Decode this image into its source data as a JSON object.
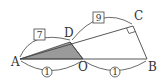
{
  "diagram": {
    "points": {
      "A": {
        "label": "A",
        "x": 20,
        "y": 59
      },
      "O": {
        "label": "O",
        "x": 83,
        "y": 59
      },
      "B": {
        "label": "B",
        "x": 147,
        "y": 59
      },
      "D": {
        "label": "D",
        "x": 70,
        "y": 42
      },
      "C": {
        "label": "C",
        "x": 133,
        "y": 26
      }
    },
    "shaded_region": "triangle ADO",
    "shade_color": "#9a9a9a",
    "stroke_color": "#444444",
    "boxed_labels": [
      {
        "text": "7",
        "segment": "AD"
      },
      {
        "text": "9",
        "segment": "DC"
      }
    ],
    "circled_labels": [
      {
        "text": "①",
        "segment": "AO"
      },
      {
        "text": "①",
        "segment": "OB"
      }
    ],
    "right_angle_at": "C"
  }
}
